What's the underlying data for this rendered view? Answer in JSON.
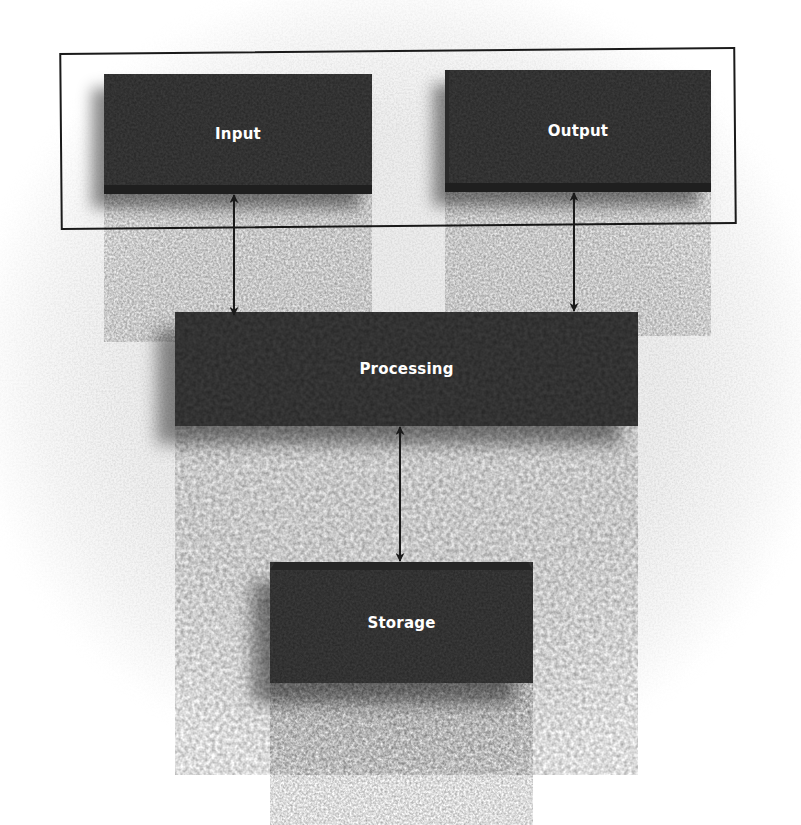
{
  "diagram": {
    "type": "block-diagram",
    "group_frame": {
      "contains": [
        "Input",
        "Output"
      ]
    },
    "nodes": {
      "input": {
        "label": "Input"
      },
      "output": {
        "label": "Output"
      },
      "processing": {
        "label": "Processing"
      },
      "storage": {
        "label": "Storage"
      }
    },
    "edges": [
      {
        "from": "Input",
        "to": "Processing",
        "direction": "bidirectional"
      },
      {
        "from": "Output",
        "to": "Processing",
        "direction": "bidirectional"
      },
      {
        "from": "Processing",
        "to": "Storage",
        "direction": "bidirectional"
      }
    ],
    "colors": {
      "box_fill": "#3b3b3b",
      "box_text": "#ffffff",
      "line": "#1a1a1a",
      "background": "#eeeeee"
    }
  }
}
